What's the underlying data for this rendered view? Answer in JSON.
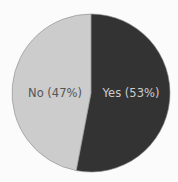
{
  "chart_data": {
    "type": "pie",
    "title": "",
    "categories": [
      "Yes",
      "No"
    ],
    "values": [
      53,
      47
    ],
    "labels": [
      "Yes (53%)",
      "No (47%)"
    ],
    "colors": [
      "#333333",
      "#cccccc"
    ],
    "label_colors": [
      "#cccccc",
      "#555555"
    ],
    "start_angle": "12 o'clock, clockwise",
    "legend": "none (inline labels)"
  },
  "background": "#fbfbfb"
}
